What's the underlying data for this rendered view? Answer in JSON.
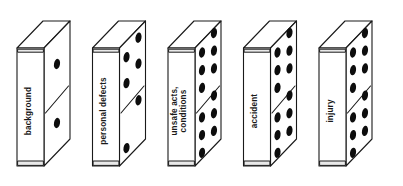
{
  "diagram": {
    "type": "domino-sequence",
    "background_color": "#ffffff",
    "line_color": "#1a1a1a",
    "pip_color": "#0d0d0d",
    "dominoes": [
      {
        "id": "background",
        "label": "background",
        "label_lines": [
          "background"
        ],
        "pips_top": 1,
        "pips_bottom": 1,
        "pip_layout_top": [
          [
            0.5,
            0.5
          ]
        ],
        "pip_layout_bottom": [
          [
            0.5,
            0.5
          ]
        ]
      },
      {
        "id": "personal-defects",
        "label": "personal defects",
        "label_lines": [
          "personal defects"
        ],
        "pips_top": 4,
        "pips_bottom": 2,
        "pip_layout_top": [
          [
            0.27,
            0.28
          ],
          [
            0.73,
            0.16
          ],
          [
            0.27,
            0.72
          ],
          [
            0.73,
            0.6
          ]
        ],
        "pip_layout_bottom": [
          [
            0.73,
            0.22
          ],
          [
            0.27,
            0.82
          ]
        ]
      },
      {
        "id": "unsafe-acts-conditions",
        "label": "unsafe acts, conditions",
        "label_lines": [
          "unsafe acts,",
          "conditions"
        ],
        "pips_top": 6,
        "pips_bottom": 6,
        "pip_layout_top": [
          [
            0.27,
            0.2
          ],
          [
            0.73,
            0.08
          ],
          [
            0.27,
            0.5
          ],
          [
            0.73,
            0.38
          ],
          [
            0.27,
            0.8
          ],
          [
            0.73,
            0.68
          ]
        ],
        "pip_layout_bottom": [
          [
            0.73,
            0.14
          ],
          [
            0.27,
            0.3
          ],
          [
            0.73,
            0.44
          ],
          [
            0.27,
            0.6
          ],
          [
            0.73,
            0.74
          ],
          [
            0.27,
            0.9
          ]
        ]
      },
      {
        "id": "accident",
        "label": "accident",
        "label_lines": [
          "accident"
        ],
        "pips_top": 6,
        "pips_bottom": 6,
        "pip_layout_top": [
          [
            0.27,
            0.2
          ],
          [
            0.73,
            0.08
          ],
          [
            0.27,
            0.5
          ],
          [
            0.73,
            0.38
          ],
          [
            0.27,
            0.8
          ],
          [
            0.73,
            0.68
          ]
        ],
        "pip_layout_bottom": [
          [
            0.73,
            0.14
          ],
          [
            0.27,
            0.3
          ],
          [
            0.73,
            0.44
          ],
          [
            0.27,
            0.6
          ],
          [
            0.73,
            0.74
          ],
          [
            0.27,
            0.9
          ]
        ]
      },
      {
        "id": "injury",
        "label": "injury",
        "label_lines": [
          "injury"
        ],
        "pips_top": 6,
        "pips_bottom": 6,
        "pip_layout_top": [
          [
            0.27,
            0.2
          ],
          [
            0.73,
            0.08
          ],
          [
            0.27,
            0.5
          ],
          [
            0.73,
            0.38
          ],
          [
            0.27,
            0.8
          ],
          [
            0.73,
            0.68
          ]
        ],
        "pip_layout_bottom": [
          [
            0.73,
            0.14
          ],
          [
            0.27,
            0.3
          ],
          [
            0.73,
            0.44
          ],
          [
            0.27,
            0.6
          ],
          [
            0.73,
            0.74
          ],
          [
            0.27,
            0.9
          ]
        ]
      }
    ]
  }
}
